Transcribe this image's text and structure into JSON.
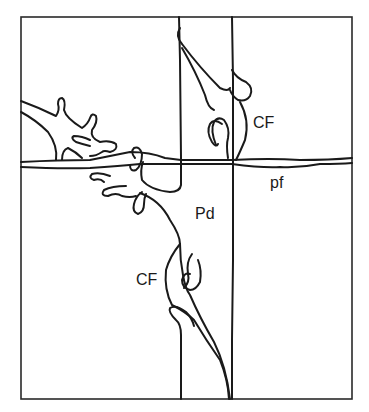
{
  "figure": {
    "labels": {
      "cf_upper": "CF",
      "cf_lower": "CF",
      "pd": "Pd",
      "pf": "pf"
    },
    "colors": {
      "line": "#1a1a1a",
      "frame": "#2a2a2a",
      "background": "#ffffff"
    }
  }
}
